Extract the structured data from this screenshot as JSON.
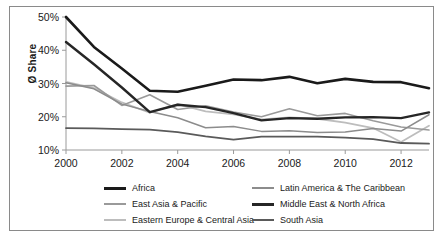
{
  "chart_data": {
    "type": "line",
    "title": "",
    "xlabel": "",
    "ylabel": "Ø Share",
    "x": [
      2000,
      2001,
      2002,
      2003,
      2004,
      2005,
      2006,
      2007,
      2008,
      2009,
      2010,
      2011,
      2012,
      2013
    ],
    "xlim": [
      2000,
      2013
    ],
    "ylim": [
      10,
      50
    ],
    "xticks": [
      "2000",
      "2002",
      "2004",
      "2006",
      "2008",
      "2010",
      "2012"
    ],
    "xtick_values": [
      2000,
      2002,
      2004,
      2006,
      2008,
      2010,
      2012
    ],
    "yticks": [
      "10%",
      "20%",
      "30%",
      "40%",
      "50%"
    ],
    "ytick_values": [
      10,
      20,
      30,
      40,
      50
    ],
    "grid": false,
    "legend_position": "bottom",
    "series": [
      {
        "name": "Africa",
        "color": "#1a1a1a",
        "width": 2.6,
        "values": [
          50.0,
          41.0,
          34.5,
          27.8,
          27.5,
          29.3,
          31.2,
          31.0,
          32.0,
          30.1,
          31.4,
          30.5,
          30.4,
          28.6
        ]
      },
      {
        "name": "East Asia & Pacific",
        "color": "#9a9a9a",
        "width": 1.6,
        "values": [
          29.2,
          29.4,
          23.4,
          26.6,
          22.2,
          23.3,
          21.4,
          20.0,
          22.4,
          20.3,
          21.0,
          18.8,
          16.9,
          16.0
        ]
      },
      {
        "name": "Eastern Europe & Central Asia",
        "color": "#bdbdbd",
        "width": 1.8,
        "values": [
          30.5,
          28.6,
          24.3,
          21.2,
          23.8,
          21.6,
          20.7,
          19.2,
          19.8,
          19.4,
          18.2,
          16.6,
          12.4,
          17.3
        ]
      },
      {
        "name": "Latin America & The Caribbean",
        "color": "#8c8c8c",
        "width": 1.5,
        "values": [
          30.2,
          28.4,
          23.8,
          21.6,
          19.7,
          16.7,
          17.1,
          15.6,
          15.8,
          15.3,
          15.4,
          16.5,
          15.7,
          20.6
        ]
      },
      {
        "name": "Middle East & North Africa",
        "color": "#262626",
        "width": 2.4,
        "values": [
          42.5,
          35.8,
          28.8,
          21.4,
          23.6,
          22.9,
          21.1,
          18.9,
          19.6,
          19.4,
          19.8,
          19.9,
          19.6,
          21.3
        ]
      },
      {
        "name": "South Asia",
        "color": "#5a5a5a",
        "width": 1.8,
        "values": [
          16.6,
          16.5,
          16.3,
          16.1,
          15.4,
          14.1,
          13.1,
          14.0,
          14.0,
          14.0,
          13.7,
          13.3,
          12.1,
          11.9
        ]
      }
    ]
  },
  "legend": {
    "rows": [
      {
        "left": {
          "label": "Africa",
          "color": "#1a1a1a",
          "thickness": 3
        },
        "right": {
          "label": "Latin America & The Caribbean",
          "color": "#8c8c8c",
          "thickness": 2
        }
      },
      {
        "left": {
          "label": "East Asia & Pacific",
          "color": "#9a9a9a",
          "thickness": 2
        },
        "right": {
          "label": "Middle East & North Africa",
          "color": "#262626",
          "thickness": 3
        }
      },
      {
        "left": {
          "label": "Eastern Europe & Central Asia",
          "color": "#bdbdbd",
          "thickness": 2
        },
        "right": {
          "label": "South Asia",
          "color": "#5a5a5a",
          "thickness": 2.5
        }
      }
    ]
  },
  "axes": {
    "axis_color": "#9a9a9a",
    "tick_color": "#9a9a9a",
    "text_color": "#1a1a1a"
  },
  "frame": {
    "border_color": "#8a8a8a",
    "background": "#ffffff"
  }
}
